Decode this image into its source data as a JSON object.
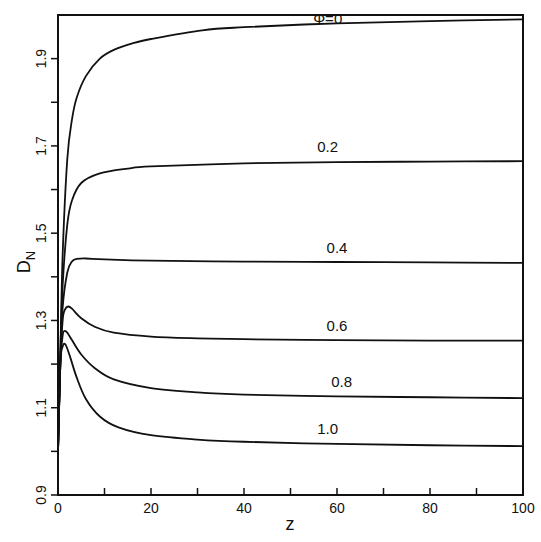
{
  "chart_data": {
    "type": "line",
    "title": "",
    "xlabel": "z",
    "ylabel": "D",
    "ylabel_subscript": "N",
    "xlim": [
      0,
      100
    ],
    "ylim": [
      0.9,
      2.0
    ],
    "grid": false,
    "legend": "inline labels",
    "x_ticks": [
      0,
      10,
      20,
      30,
      40,
      50,
      60,
      70,
      80,
      90,
      100
    ],
    "x_tick_labels": [
      "0",
      "",
      "20",
      "",
      "40",
      "",
      "60",
      "",
      "80",
      "",
      "100"
    ],
    "y_ticks": [
      0.9,
      1.0,
      1.1,
      1.2,
      1.3,
      1.4,
      1.5,
      1.6,
      1.7,
      1.8,
      1.9
    ],
    "y_tick_labels": [
      "0.9",
      "",
      "1.1",
      "",
      "1.3",
      "",
      "1.5",
      "",
      "1.7",
      "",
      "1.9"
    ],
    "series": [
      {
        "name": "Φ=0",
        "label": "Φ=0",
        "label_pos": [
          58,
          1.98
        ],
        "x": [
          0,
          0.5,
          1,
          2,
          3,
          4,
          6,
          9,
          12,
          16,
          20,
          31,
          40,
          60,
          80,
          100
        ],
        "y": [
          1.0,
          1.22,
          1.45,
          1.67,
          1.76,
          1.81,
          1.86,
          1.9,
          1.92,
          1.935,
          1.945,
          1.965,
          1.972,
          1.981,
          1.986,
          1.99
        ]
      },
      {
        "name": "0.2",
        "label": "0.2",
        "label_pos": [
          58,
          1.685
        ],
        "x": [
          0,
          0.5,
          1,
          2,
          3,
          5,
          9,
          15,
          20,
          40,
          60,
          80,
          100
        ],
        "y": [
          1.0,
          1.22,
          1.38,
          1.52,
          1.575,
          1.615,
          1.637,
          1.648,
          1.653,
          1.66,
          1.663,
          1.664,
          1.665
        ]
      },
      {
        "name": "0.4",
        "label": "0.4",
        "label_pos": [
          60,
          1.455
        ],
        "x": [
          0,
          0.5,
          1,
          2,
          3,
          4,
          6,
          10,
          20,
          40,
          60,
          80,
          100
        ],
        "y": [
          1.0,
          1.2,
          1.33,
          1.41,
          1.435,
          1.441,
          1.442,
          1.44,
          1.437,
          1.435,
          1.434,
          1.433,
          1.432
        ]
      },
      {
        "name": "0.6",
        "label": "0.6",
        "label_pos": [
          60,
          1.275
        ],
        "x": [
          0,
          0.5,
          1,
          1.5,
          2.2,
          3,
          5,
          8,
          12,
          20,
          30,
          40,
          60,
          80,
          100
        ],
        "y": [
          1.0,
          1.2,
          1.3,
          1.325,
          1.332,
          1.327,
          1.305,
          1.285,
          1.272,
          1.263,
          1.259,
          1.257,
          1.255,
          1.254,
          1.254
        ]
      },
      {
        "name": "0.8",
        "label": "0.8",
        "label_pos": [
          61,
          1.148
        ],
        "x": [
          0,
          0.5,
          1,
          1.4,
          2,
          3,
          5,
          8,
          12,
          20,
          30,
          40,
          60,
          80,
          100
        ],
        "y": [
          1.0,
          1.2,
          1.265,
          1.276,
          1.272,
          1.255,
          1.222,
          1.19,
          1.165,
          1.145,
          1.135,
          1.13,
          1.126,
          1.124,
          1.122
        ]
      },
      {
        "name": "1.0",
        "label": "1.0",
        "label_pos": [
          58,
          1.04
        ],
        "x": [
          0,
          0.5,
          1,
          1.6,
          2.5,
          4,
          6,
          9,
          13,
          20,
          30,
          40,
          60,
          80,
          100
        ],
        "y": [
          1.0,
          1.2,
          1.24,
          1.245,
          1.22,
          1.17,
          1.12,
          1.08,
          1.055,
          1.037,
          1.027,
          1.022,
          1.017,
          1.014,
          1.012
        ]
      }
    ]
  }
}
